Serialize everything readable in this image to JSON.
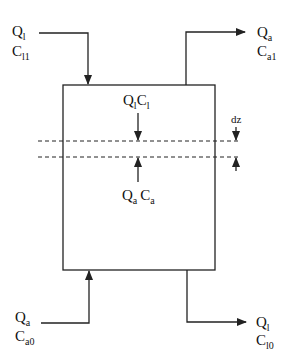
{
  "diagram": {
    "type": "countercurrent column mass balance schematic",
    "colors": {
      "line": "#222222",
      "background": "#ffffff"
    },
    "streams": {
      "liquid_in": {
        "flow": "Q",
        "flow_sub": "l",
        "conc": "C",
        "conc_sub": "l1",
        "direction": "in-top-left"
      },
      "gas_out": {
        "flow": "Q",
        "flow_sub": "a",
        "conc": "C",
        "conc_sub": "a1",
        "direction": "out-top-right"
      },
      "gas_in": {
        "flow": "Q",
        "flow_sub": "a",
        "conc": "C",
        "conc_sub": "a0",
        "direction": "in-bottom-left"
      },
      "liquid_out": {
        "flow": "Q",
        "flow_sub": "l",
        "conc": "C",
        "conc_sub": "l0",
        "direction": "out-bottom-right"
      }
    },
    "element": {
      "liquid_label": {
        "q": "Q",
        "q_sub": "l",
        "c": "C",
        "c_sub": "l"
      },
      "gas_label": {
        "q": "Q",
        "q_sub": "a",
        "c": "C",
        "c_sub": "a"
      },
      "thickness_label": "dz"
    }
  }
}
